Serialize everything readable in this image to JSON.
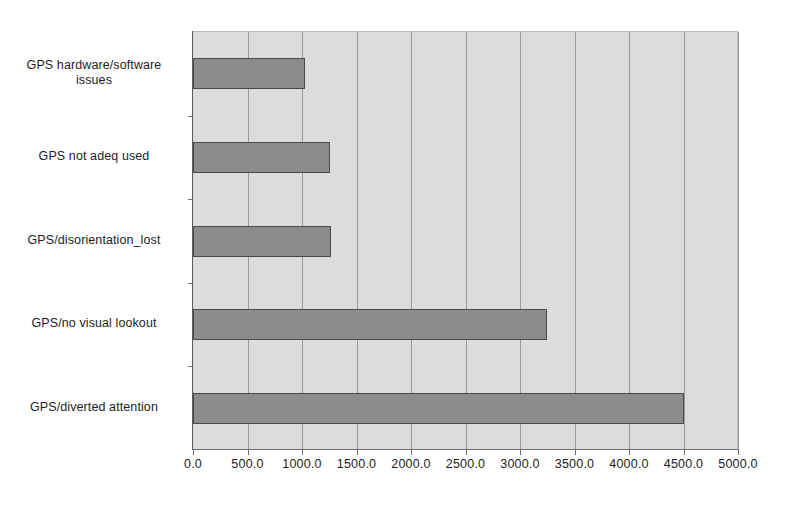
{
  "chart_data": {
    "type": "bar",
    "orientation": "horizontal",
    "title": "",
    "subtitle": "",
    "xlabel": "",
    "ylabel": "",
    "categories": [
      "GPS hardware/software issues",
      "GPS not adeq used",
      "GPS/disorientation_lost",
      "GPS/no visual lookout",
      "GPS/diverted attention"
    ],
    "values": [
      1030,
      1260,
      1270,
      3250,
      4500
    ],
    "xlim": [
      0,
      5000
    ],
    "xticks": [
      0,
      500,
      1000,
      1500,
      2000,
      2500,
      3000,
      3500,
      4000,
      4500,
      5000
    ],
    "xtick_labels": [
      "0.0",
      "500.0",
      "1000.0",
      "1500.0",
      "2000.0",
      "2500.0",
      "3000.0",
      "3500.0",
      "4000.0",
      "4500.0",
      "5000.0"
    ],
    "grid": true,
    "grid_axis": "x",
    "legend": false,
    "legend_position": "none",
    "colors": {
      "bar_fill": "#8c8c8c",
      "bar_edge": "#4a4a4a",
      "plot_background": "#dcdcdc",
      "gridline": "#9a9a9a",
      "axis": "#6e6e6e",
      "text": "#1d1d1d",
      "figure_background": "#ffffff"
    }
  },
  "category_label_lines": [
    [
      "GPS hardware/software",
      "issues"
    ],
    [
      "GPS not adeq used"
    ],
    [
      "GPS/disorientation_lost"
    ],
    [
      "GPS/no visual lookout"
    ],
    [
      "GPS/diverted attention"
    ]
  ]
}
